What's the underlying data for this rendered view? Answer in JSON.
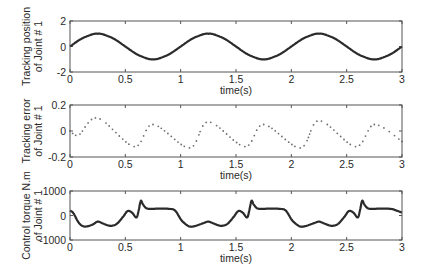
{
  "figure": {
    "background": "#ffffff",
    "axis_color": "#555555",
    "line_color": "#2b2b2b",
    "dot_color": "#6e6e6e"
  },
  "chart_data": [
    {
      "type": "line",
      "title": "",
      "xlabel": "time(s)",
      "ylabel": [
        "Tracking position",
        "of Joint # 1"
      ],
      "xlim": [
        0,
        3
      ],
      "ylim": [
        -2,
        2
      ],
      "xticks": [
        "0",
        "0.5",
        "1",
        "1.5",
        "2",
        "2.5",
        "3"
      ],
      "yticks": [
        "2",
        "0",
        "-2"
      ],
      "ytick_values": [
        2,
        0,
        -2
      ],
      "grid": false,
      "line_style": "solid-thick",
      "function": "sin(2*pi*t)",
      "x": [
        0,
        0.1,
        0.2,
        0.25,
        0.3,
        0.4,
        0.5,
        0.6,
        0.7,
        0.75,
        0.8,
        0.9,
        1.0,
        1.1,
        1.2,
        1.25,
        1.3,
        1.4,
        1.5,
        1.6,
        1.7,
        1.75,
        1.8,
        1.9,
        2.0,
        2.1,
        2.2,
        2.25,
        2.3,
        2.4,
        2.5,
        2.6,
        2.7,
        2.75,
        2.8,
        2.9,
        3.0
      ],
      "values": [
        0,
        0.59,
        0.95,
        1.0,
        0.95,
        0.59,
        0,
        -0.59,
        -0.95,
        -1.0,
        -0.95,
        -0.59,
        0,
        0.59,
        0.95,
        1.0,
        0.95,
        0.59,
        0,
        -0.59,
        -0.95,
        -1.0,
        -0.95,
        -0.59,
        0,
        0.59,
        0.95,
        1.0,
        0.95,
        0.59,
        0,
        -0.59,
        -0.95,
        -1.0,
        -0.95,
        -0.59,
        0
      ]
    },
    {
      "type": "line",
      "title": "",
      "xlabel": "time(s)",
      "ylabel": [
        "Tracking error",
        "of Joint # 1"
      ],
      "xlim": [
        0,
        3
      ],
      "ylim": [
        -0.2,
        0.2
      ],
      "xticks": [
        "0",
        "0.5",
        "1",
        "1.5",
        "2",
        "2.5",
        "3"
      ],
      "yticks": [
        "0.2",
        "0",
        "-0.2"
      ],
      "ytick_values": [
        0.2,
        0,
        -0.2
      ],
      "grid": false,
      "line_style": "dotted",
      "x": [
        0,
        0.08,
        0.25,
        0.58,
        0.75,
        1.08,
        1.25,
        1.58,
        1.75,
        2.08,
        2.25,
        2.58,
        2.75,
        3.0
      ],
      "values": [
        0,
        -0.03,
        0.1,
        -0.12,
        0.05,
        -0.13,
        0.07,
        -0.12,
        0.05,
        -0.13,
        0.08,
        -0.12,
        0.05,
        -0.08
      ]
    },
    {
      "type": "line",
      "title": "",
      "xlabel": "time(s)",
      "ylabel": [
        "Control torque N.m",
        "of Joint # 1"
      ],
      "xlim": [
        0,
        3
      ],
      "ylim": [
        -1000,
        1000
      ],
      "xticks": [
        "0",
        "0.5",
        "1",
        "1.5",
        "2",
        "2.5",
        "3"
      ],
      "yticks": [
        "1000",
        "0",
        "-1000"
      ],
      "ytick_values": [
        1000,
        0,
        -1000
      ],
      "grid": false,
      "line_style": "solid-thick",
      "x": [
        0,
        0.03,
        0.08,
        0.13,
        0.2,
        0.25,
        0.3,
        0.36,
        0.42,
        0.48,
        0.52,
        0.56,
        0.6,
        0.62,
        0.64,
        0.66,
        0.7,
        0.8,
        0.9,
        0.95,
        1.0,
        1.03,
        1.08,
        1.13,
        1.2,
        1.25,
        1.3,
        1.36,
        1.42,
        1.48,
        1.52,
        1.56,
        1.6,
        1.62,
        1.64,
        1.66,
        1.7,
        1.8,
        1.9,
        1.95,
        2.0,
        2.03,
        2.08,
        2.13,
        2.2,
        2.25,
        2.3,
        2.36,
        2.42,
        2.48,
        2.52,
        2.56,
        2.6,
        2.62,
        2.64,
        2.66,
        2.7,
        2.8,
        2.9,
        2.95,
        3.0
      ],
      "values": [
        200,
        100,
        -300,
        -450,
        -380,
        -250,
        -330,
        -420,
        -350,
        -50,
        180,
        120,
        -80,
        200,
        600,
        450,
        280,
        280,
        270,
        200,
        -150,
        -300,
        -450,
        -430,
        -320,
        -250,
        -330,
        -420,
        -350,
        -50,
        180,
        120,
        -80,
        200,
        600,
        450,
        280,
        280,
        270,
        200,
        -150,
        -300,
        -450,
        -430,
        -320,
        -250,
        -330,
        -420,
        -350,
        -50,
        180,
        120,
        -80,
        200,
        600,
        450,
        280,
        280,
        270,
        200,
        120
      ]
    }
  ]
}
